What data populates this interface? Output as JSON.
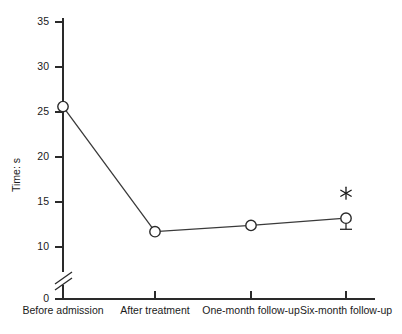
{
  "chart_data": {
    "type": "line",
    "title": "",
    "xlabel": "",
    "ylabel": "Time: s",
    "categories": [
      "Before admission",
      "After treatment",
      "One-month follow-up",
      "Six-month follow-up"
    ],
    "values": [
      25.6,
      11.7,
      12.4,
      13.2
    ],
    "yticks": [
      "0",
      "10",
      "15",
      "20",
      "25",
      "30",
      "35"
    ],
    "ylim": [
      0,
      35
    ],
    "axis_break": true,
    "axis_break_between": [
      0,
      10
    ],
    "grid": false,
    "legend": null,
    "markers": "open-circle",
    "annotations": [
      {
        "point_index": 3,
        "symbol": "*",
        "position": "above",
        "meaning": "significance-marker"
      },
      {
        "point_index": 3,
        "symbol": "error-bar",
        "position": "below",
        "value": 0.9
      }
    ]
  },
  "axis": {
    "y_label": "Time: s",
    "y_tick_35": "35",
    "y_tick_30": "30",
    "y_tick_25": "25",
    "y_tick_20": "20",
    "y_tick_15": "15",
    "y_tick_10": "10",
    "y_tick_0": "0",
    "x_tick_1": "Before admission",
    "x_tick_2": "After treatment",
    "x_tick_3": "One-month follow-up",
    "x_tick_4": "Six-month follow-up"
  },
  "colors": {
    "line": "#3a3a3a",
    "axis": "#2a2a2a",
    "marker_fill": "#ffffff",
    "background": "#ffffff"
  }
}
